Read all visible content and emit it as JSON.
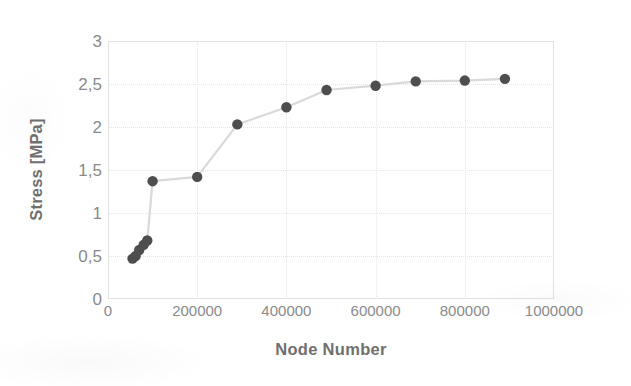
{
  "chart_data": {
    "type": "scatter",
    "title": "",
    "xlabel": "Node Number",
    "ylabel": "Stress [MPa]",
    "xlim": [
      0,
      1000000
    ],
    "ylim": [
      0,
      3
    ],
    "grid": true,
    "legend": false,
    "decimal_separator": ",",
    "marker_color": "#4e4e4e",
    "line_color": "#d9d9d9",
    "x_ticks": [
      0,
      200000,
      400000,
      600000,
      800000,
      1000000
    ],
    "x_tick_labels": [
      "0",
      "200000",
      "400000",
      "600000",
      "800000",
      "1000000"
    ],
    "y_ticks": [
      0,
      0.5,
      1,
      1.5,
      2,
      2.5,
      3
    ],
    "y_tick_labels": [
      "0",
      "0,5",
      "1",
      "1,5",
      "2",
      "2,5",
      "3"
    ],
    "series": [
      {
        "name": "Stress vs Node Number",
        "x": [
          55000,
          62000,
          70000,
          80000,
          88000,
          100000,
          200000,
          290000,
          400000,
          490000,
          600000,
          690000,
          800000,
          890000
        ],
        "y": [
          0.47,
          0.5,
          0.57,
          0.63,
          0.68,
          1.37,
          1.42,
          2.03,
          2.23,
          2.43,
          2.48,
          2.53,
          2.54,
          2.56
        ]
      }
    ]
  }
}
